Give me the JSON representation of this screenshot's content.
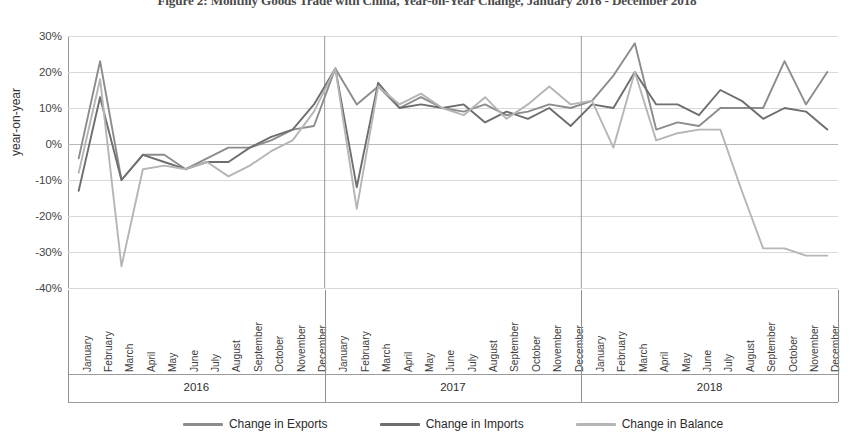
{
  "figure": {
    "title": "Figure 2: Monthly Goods Trade with China, Year-on-Year Change, January 2016 - December 2018"
  },
  "chart_data": {
    "type": "line",
    "title": "Figure 2: Monthly Goods Trade with China, Year-on-Year Change, January 2016 - December 2018",
    "xlabel": "",
    "ylabel": "year-on-year",
    "ylim": [
      -40,
      30
    ],
    "ytick_labels": [
      "30%",
      "20%",
      "10%",
      "0%",
      "-10%",
      "-20%",
      "-30%",
      "-40%"
    ],
    "ytick_values": [
      30,
      20,
      10,
      0,
      -10,
      -20,
      -30,
      -40
    ],
    "grid": true,
    "legend_position": "bottom",
    "years": [
      "2016",
      "2017",
      "2018"
    ],
    "months": [
      "January",
      "February",
      "March",
      "April",
      "May",
      "June",
      "July",
      "August",
      "September",
      "October",
      "November",
      "December"
    ],
    "categories": [
      "January 2016",
      "February 2016",
      "March 2016",
      "April 2016",
      "May 2016",
      "June 2016",
      "July 2016",
      "August 2016",
      "September 2016",
      "October 2016",
      "November 2016",
      "December 2016",
      "January 2017",
      "February 2017",
      "March 2017",
      "April 2017",
      "May 2017",
      "June 2017",
      "July 2017",
      "August 2017",
      "September 2017",
      "October 2017",
      "November 2017",
      "December 2017",
      "January 2018",
      "February 2018",
      "March 2018",
      "April 2018",
      "May 2018",
      "June 2018",
      "July 2018",
      "August 2018",
      "September 2018",
      "October 2018",
      "November 2018",
      "December 2018"
    ],
    "series": [
      {
        "name": "Change in Exports",
        "color": "#8c8c8c",
        "values": [
          -4,
          23,
          -10,
          -3,
          -3,
          -7,
          -4,
          -1,
          -1,
          1,
          4,
          5,
          21,
          11,
          16,
          10,
          13,
          10,
          9,
          11,
          8,
          9,
          11,
          10,
          12,
          19,
          28,
          4,
          6,
          5,
          10,
          10,
          10,
          23,
          11,
          20
        ]
      },
      {
        "name": "Change in Imports",
        "color": "#6e6e6e",
        "values": [
          -13,
          13,
          -10,
          -3,
          -5,
          -7,
          -5,
          -5,
          -1,
          2,
          4,
          11,
          21,
          -12,
          17,
          10,
          11,
          10,
          11,
          6,
          9,
          7,
          10,
          5,
          11,
          10,
          20,
          11,
          11,
          8,
          15,
          12,
          7,
          10,
          9,
          4
        ]
      },
      {
        "name": "Change in Balance",
        "color": "#b5b5b5",
        "values": [
          -8,
          18,
          -34,
          -7,
          -6,
          -7,
          -5,
          -9,
          -6,
          -2,
          1,
          9,
          21,
          -18,
          16,
          11,
          14,
          10,
          8,
          13,
          7,
          11,
          16,
          11,
          12,
          -1,
          20,
          1,
          3,
          4,
          4,
          -13,
          -29,
          -29,
          -31,
          -31
        ]
      }
    ]
  },
  "legend": {
    "items": [
      {
        "label": "Change in Exports",
        "color": "#8c8c8c"
      },
      {
        "label": "Change in Imports",
        "color": "#6e6e6e"
      },
      {
        "label": "Change in Balance",
        "color": "#b5b5b5"
      }
    ]
  }
}
